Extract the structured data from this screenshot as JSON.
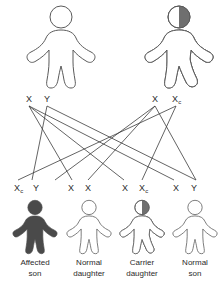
{
  "diagram": {
    "colors": {
      "outline": "#5a5a5a",
      "affected_fill": "#4a4a4a",
      "carrier_fill": "#7d7d7d",
      "unaffected_fill": "#ffffff",
      "line": "#3c3c3c",
      "text": "#2b2b2b",
      "background": "#ffffff"
    },
    "parents": [
      {
        "id": "parent-father",
        "status": "unaffected",
        "fill": "none",
        "genotype": "X Y",
        "alleles": [
          {
            "symbol": "X",
            "sub": ""
          },
          {
            "symbol": "Y",
            "sub": ""
          }
        ]
      },
      {
        "id": "parent-mother",
        "status": "carrier",
        "fill": "half",
        "genotype": "X Xc",
        "alleles": [
          {
            "symbol": "X",
            "sub": ""
          },
          {
            "symbol": "X",
            "sub": "c"
          }
        ]
      }
    ],
    "offspring": [
      {
        "id": "child-1",
        "status": "affected",
        "fill": "full",
        "alleles": [
          {
            "symbol": "X",
            "sub": "c"
          },
          {
            "symbol": "Y",
            "sub": ""
          }
        ],
        "caption_line1": "Affected",
        "caption_line2": "son"
      },
      {
        "id": "child-2",
        "status": "normal",
        "fill": "none",
        "alleles": [
          {
            "symbol": "X",
            "sub": ""
          },
          {
            "symbol": "X",
            "sub": ""
          }
        ],
        "caption_line1": "Normal",
        "caption_line2": "daughter"
      },
      {
        "id": "child-3",
        "status": "carrier",
        "fill": "half",
        "alleles": [
          {
            "symbol": "X",
            "sub": ""
          },
          {
            "symbol": "X",
            "sub": "c"
          }
        ],
        "caption_line1": "Carrier",
        "caption_line2": "daughter"
      },
      {
        "id": "child-4",
        "status": "normal",
        "fill": "none",
        "alleles": [
          {
            "symbol": "X",
            "sub": ""
          },
          {
            "symbol": "Y",
            "sub": ""
          }
        ],
        "caption_line1": "Normal",
        "caption_line2": "son"
      }
    ]
  }
}
